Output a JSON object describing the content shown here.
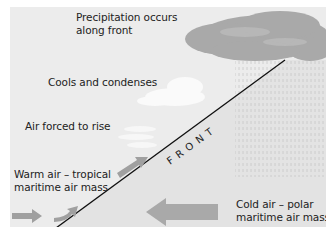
{
  "diagram": {
    "title_labels": {
      "precipitation": [
        "Precipitation occurs",
        "along front"
      ],
      "cools": "Cools and condenses",
      "rise": "Air forced to rise",
      "warm_air": [
        "Warm air – tropical",
        "maritime air mass"
      ],
      "cold_air": [
        "Cold air – polar",
        "maritime air mass"
      ],
      "front": "FRONT"
    },
    "colors": {
      "background": "#ececec",
      "cold_side": "#e2e2e2",
      "cloud": "#a8a8a8",
      "arrow": "#a0a0a0",
      "front_line": "#111111"
    }
  }
}
